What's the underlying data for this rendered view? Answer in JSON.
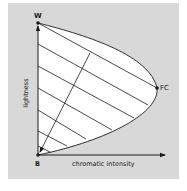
{
  "diagram": {
    "type": "color-triangle",
    "points": {
      "white": {
        "label": "W"
      },
      "black": {
        "label": "B"
      },
      "full_color": {
        "label": "FC"
      }
    },
    "axes": {
      "x_label": "chromatic intensity",
      "y_label": "lightness"
    },
    "colors": {
      "panel_background": "#d8d8d8",
      "gamut_fill": "#ffffff",
      "stroke": "#1a1a1a"
    }
  }
}
